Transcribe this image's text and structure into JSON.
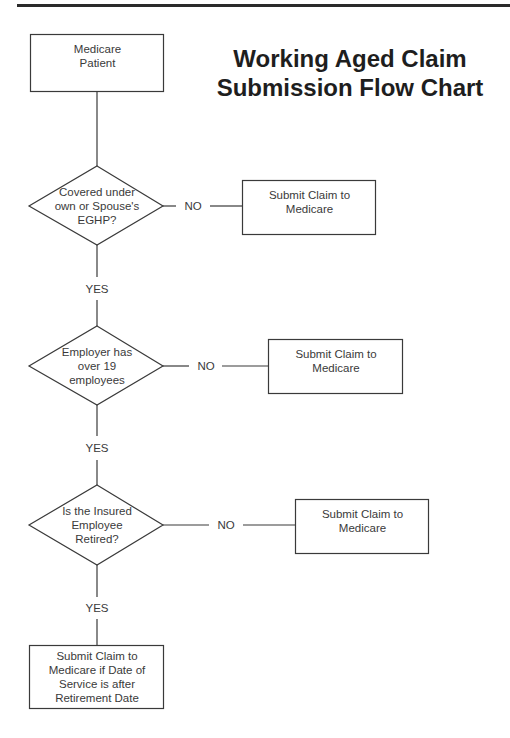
{
  "title": {
    "line1": "Working Aged Claim",
    "line2": "Submission Flow Chart"
  },
  "nodes": {
    "start": {
      "type": "process",
      "lines": [
        "Medicare",
        "Patient"
      ]
    },
    "decision1": {
      "type": "decision",
      "lines": [
        "Covered under",
        "own or Spouse's",
        "EGHP?"
      ]
    },
    "decision2": {
      "type": "decision",
      "lines": [
        "Employer has",
        "over 19",
        "employees"
      ]
    },
    "decision3": {
      "type": "decision",
      "lines": [
        "Is the Insured",
        "Employee",
        "Retired?"
      ]
    },
    "outcome1": {
      "type": "process",
      "lines": [
        "Submit Claim to",
        "Medicare"
      ]
    },
    "outcome2": {
      "type": "process",
      "lines": [
        "Submit Claim to",
        "Medicare"
      ]
    },
    "outcome3": {
      "type": "process",
      "lines": [
        "Submit Claim to",
        "Medicare"
      ]
    },
    "final": {
      "type": "process",
      "lines": [
        "Submit Claim to",
        "Medicare if Date of",
        "Service is after",
        "Retirement Date"
      ]
    }
  },
  "edges": {
    "d1_no": "NO",
    "d1_yes": "YES",
    "d2_no": "NO",
    "d2_yes": "YES",
    "d3_no": "NO",
    "d3_yes": "YES"
  },
  "colors": {
    "line": "#3a3a3a",
    "text": "#3a3a3a",
    "title": "#1e1e1e",
    "rule": "#2a2a2a",
    "background": "#ffffff"
  }
}
